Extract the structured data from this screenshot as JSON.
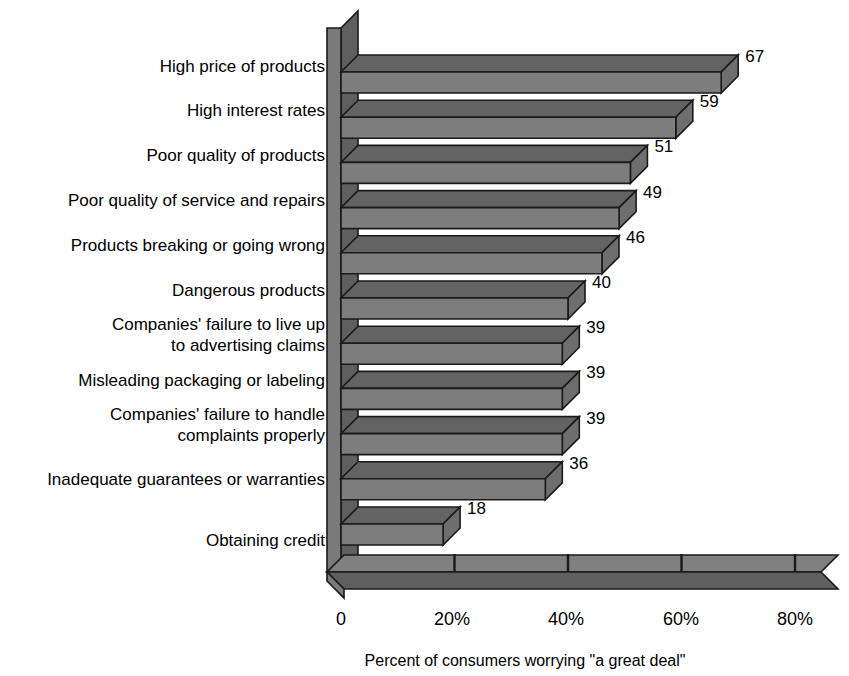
{
  "chart_data": {
    "type": "bar",
    "orientation": "horizontal",
    "style": "3d",
    "title": "",
    "subtitle": "",
    "xlabel": "Percent of consumers worrying \"a great deal\"",
    "ylabel": "",
    "xlim": [
      0,
      88
    ],
    "xticks": [
      0,
      20,
      40,
      60,
      80
    ],
    "xticklabels": [
      "0",
      "20%",
      "40%",
      "60%",
      "80%"
    ],
    "grid": false,
    "legend": null,
    "categories": [
      "High price of products",
      "High interest rates",
      "Poor quality of products",
      "Poor quality of service and repairs",
      "Products breaking or going wrong",
      "Dangerous products",
      "Companies' failure to live up\nto advertising claims",
      "Misleading packaging or labeling",
      "Companies' failure to handle\ncomplaints properly",
      "Inadequate guarantees or warranties",
      "Obtaining credit"
    ],
    "values": [
      67,
      59,
      51,
      49,
      46,
      40,
      39,
      39,
      39,
      36,
      18
    ],
    "value_labels": [
      "67",
      "59",
      "51",
      "49",
      "46",
      "40",
      "39",
      "39",
      "39",
      "36",
      "18"
    ],
    "colors": {
      "bar_front": "#7d7d7d",
      "bar_top": "#636363",
      "bar_side": "#6e6e6e",
      "wall": "#7a7a7a",
      "wall_dark": "#5f5f5f",
      "floor": "#808080",
      "outline": "#1a1a1a",
      "background": "#ffffff",
      "text": "#000000"
    }
  },
  "axis": {
    "caption": "Percent of consumers worrying \"a great deal\"",
    "tick_0": "0",
    "tick_20": "20%",
    "tick_40": "40%",
    "tick_60": "60%",
    "tick_80": "80%"
  },
  "labels": {
    "cat_0": "High price of products",
    "cat_1": "High interest rates",
    "cat_2": "Poor quality of products",
    "cat_3": "Poor quality of service and repairs",
    "cat_4": "Products breaking or going wrong",
    "cat_5": "Dangerous products",
    "cat_6_line1": "Companies' failure to live up",
    "cat_6_line2": "to advertising claims",
    "cat_7": "Misleading packaging or labeling",
    "cat_8_line1": "Companies' failure to handle",
    "cat_8_line2": "complaints properly",
    "cat_9": "Inadequate guarantees or warranties",
    "cat_10": "Obtaining credit"
  },
  "values": {
    "v_0": "67",
    "v_1": "59",
    "v_2": "51",
    "v_3": "49",
    "v_4": "46",
    "v_5": "40",
    "v_6": "39",
    "v_7": "39",
    "v_8": "39",
    "v_9": "36",
    "v_10": "18"
  }
}
